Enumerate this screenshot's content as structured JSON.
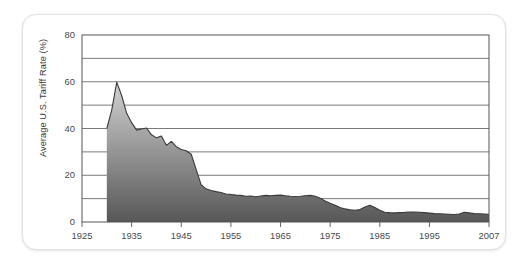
{
  "chart_data": {
    "type": "area",
    "title": "",
    "xlabel": "",
    "ylabel": "Average U.S. Tariff Rate (%)",
    "xlim": [
      1925,
      2007
    ],
    "ylim": [
      0,
      80
    ],
    "grid": true,
    "legend": "none",
    "y_ticks_labeled": [
      0,
      20,
      40,
      60,
      80
    ],
    "y_gridlines": [
      0,
      10,
      20,
      30,
      40,
      50,
      60,
      70,
      80
    ],
    "x_ticks_labeled": [
      1925,
      1935,
      1945,
      1955,
      1965,
      1975,
      1985,
      1995,
      2007
    ],
    "series": [
      {
        "name": "Average U.S. Tariff Rate",
        "x": [
          1930,
          1931,
          1932,
          1933,
          1934,
          1935,
          1936,
          1937,
          1938,
          1939,
          1940,
          1941,
          1942,
          1943,
          1944,
          1945,
          1946,
          1947,
          1948,
          1949,
          1950,
          1951,
          1952,
          1953,
          1954,
          1955,
          1956,
          1957,
          1958,
          1959,
          1960,
          1961,
          1962,
          1963,
          1964,
          1965,
          1966,
          1967,
          1968,
          1969,
          1970,
          1971,
          1972,
          1973,
          1974,
          1975,
          1976,
          1977,
          1978,
          1979,
          1980,
          1981,
          1982,
          1983,
          1984,
          1985,
          1986,
          1987,
          1988,
          1989,
          1990,
          1991,
          1992,
          1993,
          1994,
          1995,
          1996,
          1997,
          1998,
          1999,
          2000,
          2001,
          2002,
          2003,
          2004,
          2005,
          2006,
          2007
        ],
        "values": [
          40.0,
          48.0,
          59.8,
          54.0,
          46.5,
          42.5,
          39.3,
          39.8,
          40.2,
          37.3,
          36.0,
          36.8,
          32.8,
          34.5,
          32.2,
          31.0,
          30.5,
          29.0,
          22.5,
          16.0,
          14.2,
          13.5,
          13.0,
          12.6,
          12.0,
          11.8,
          11.5,
          11.4,
          11.0,
          11.1,
          10.8,
          11.1,
          11.4,
          11.2,
          11.4,
          11.5,
          11.2,
          11.0,
          10.9,
          11.0,
          11.2,
          11.4,
          11.0,
          10.2,
          9.0,
          8.0,
          7.2,
          6.2,
          5.6,
          5.2,
          5.0,
          5.3,
          6.4,
          7.2,
          6.2,
          5.0,
          4.2,
          4.0,
          3.9,
          4.0,
          4.1,
          4.3,
          4.3,
          4.2,
          4.0,
          3.8,
          3.6,
          3.5,
          3.4,
          3.3,
          3.2,
          3.4,
          4.2,
          3.9,
          3.6,
          3.5,
          3.4,
          3.3
        ],
        "fill_gradient_top": "#d2d2d2",
        "fill_gradient_bottom": "#575757",
        "line_color": "#3b3b3b"
      }
    ],
    "axis_color": "#555555",
    "grid_color": "#6b6b6b",
    "background": "#ffffff"
  },
  "plot_geometry": {
    "left": 82,
    "right": 489,
    "top": 35,
    "bottom": 222
  }
}
